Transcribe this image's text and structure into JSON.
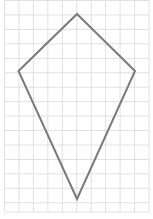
{
  "diagram": {
    "type": "kite-on-grid",
    "grid": {
      "x0": 4.5,
      "y0": 0.5,
      "spacing": 14.45,
      "columns": 10,
      "rows": 14,
      "bottom": 212,
      "color": "#d9d9d9"
    },
    "shape": {
      "name": "kite",
      "stroke": "#7a7a7a",
      "stroke_width": 2,
      "vertices": [
        {
          "label": "top",
          "x": 77,
          "y": 14
        },
        {
          "label": "right",
          "x": 135,
          "y": 71
        },
        {
          "label": "bottom",
          "x": 77,
          "y": 199
        },
        {
          "label": "left",
          "x": 18.5,
          "y": 71
        }
      ]
    }
  }
}
